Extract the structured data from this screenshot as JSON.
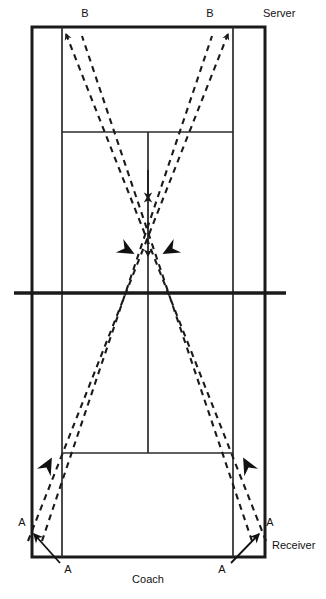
{
  "diagram": {
    "type": "tennis-court-drill-diagram",
    "colors": {
      "line": "#1a1a1a",
      "court_line": "#2b2b2b",
      "dashed_path": "#1a1a1a",
      "background": "#ffffff",
      "text": "#111111"
    },
    "labels": [
      {
        "id": "b-left",
        "text": "B",
        "x": 85,
        "y": 14,
        "align": "center"
      },
      {
        "id": "b-right",
        "text": "B",
        "x": 210,
        "y": 14,
        "align": "center"
      },
      {
        "id": "server",
        "text": "Server",
        "x": 263,
        "y": 14,
        "align": "left"
      },
      {
        "id": "a-left-out",
        "text": "A",
        "x": 22,
        "y": 523,
        "align": "center"
      },
      {
        "id": "a-right-out",
        "text": "A",
        "x": 270,
        "y": 523,
        "align": "center"
      },
      {
        "id": "a-left-in",
        "text": "A",
        "x": 68,
        "y": 570,
        "align": "center"
      },
      {
        "id": "a-right-in",
        "text": "A",
        "x": 222,
        "y": 570,
        "align": "center"
      },
      {
        "id": "receiver",
        "text": "Receiver",
        "x": 273,
        "y": 546,
        "align": "left"
      },
      {
        "id": "coach",
        "text": "Coach",
        "x": 148,
        "y": 581,
        "align": "center"
      }
    ],
    "court": {
      "outer_left": 32,
      "outer_right": 265,
      "outer_top": 27,
      "outer_bottom": 557,
      "singles_left": 62,
      "singles_right": 233,
      "service_line_top": 132,
      "service_line_bottom": 453,
      "center_x": 148,
      "net_y": 293,
      "net_left": 14,
      "net_right": 286
    },
    "paths": {
      "description": "Two dashed rally paths crossing near the center of the court, from the baseline corners (A) to the far service boxes (B)",
      "crossing_point": {
        "x": 148,
        "y": 200
      }
    },
    "markers": {
      "top_left_arrow": "up-left",
      "top_right_arrow": "up-right",
      "center_arrows": "inward-converging",
      "mid_left_arrow": "up-right",
      "mid_right_arrow": "up-left",
      "bottom_left_solid_arrow": "up-left",
      "bottom_right_solid_arrow": "up-right"
    }
  }
}
